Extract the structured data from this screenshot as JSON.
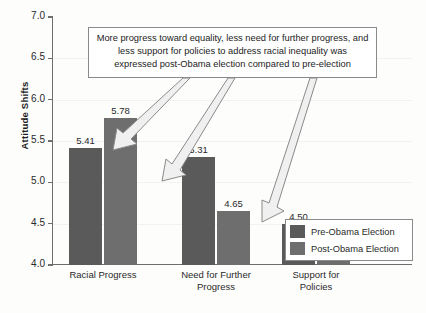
{
  "chart_data": {
    "type": "bar",
    "title": "",
    "xlabel": "",
    "ylabel": "Attitude Shifts",
    "ylim": [
      4.0,
      7.0
    ],
    "ytick_labels": [
      "7.0",
      "6.5",
      "6.0",
      "5.5",
      "5.0",
      "4.5",
      "4.0"
    ],
    "ytick_values": [
      7.0,
      6.5,
      6.0,
      5.5,
      5.0,
      4.5,
      4.0
    ],
    "grid": false,
    "legend_position": "lower-right",
    "categories": [
      "Racial Progress",
      "Need for Further\nProgress",
      "Support for\nPolicies"
    ],
    "series": [
      {
        "name": "Pre-Obama Election",
        "color": "#5a5a5a",
        "values": [
          5.41,
          5.31,
          4.5
        ],
        "value_labels": [
          "5.41",
          "5.31",
          "4.50"
        ]
      },
      {
        "name": "Post-Obama Election",
        "color": "#6e6e6e",
        "values": [
          5.78,
          4.65,
          4.25
        ],
        "value_labels": [
          "5.78",
          "4.65",
          "4.25"
        ]
      }
    ],
    "annotations": [
      {
        "name": "callout-note",
        "text": "More progress toward equality, less need for further progress, and less support for policies to address racial inequality was expressed post-Obama election compared to pre-election",
        "arrow_count": 3
      }
    ]
  },
  "legend": {
    "items": [
      {
        "label": "Pre-Obama Election",
        "color": "#5a5a5a"
      },
      {
        "label": "Post-Obama Election",
        "color": "#6e6e6e"
      }
    ]
  }
}
